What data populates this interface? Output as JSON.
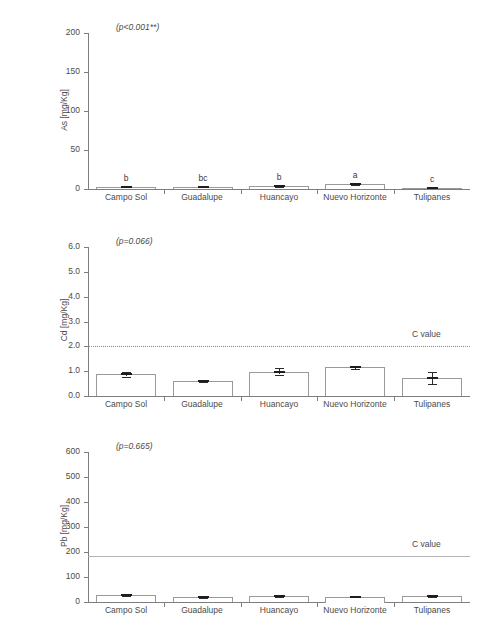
{
  "chart_data": [
    {
      "type": "bar",
      "id": "as-panel",
      "title": "",
      "ylabel": "As [mg/Kg]",
      "xlabel": "",
      "annotation": "(p<0.001**)",
      "ylim": [
        0,
        200
      ],
      "yticks": [
        0,
        50,
        100,
        150,
        200
      ],
      "ytick_labels": [
        "0",
        "50",
        "100",
        "150",
        "200"
      ],
      "categories": [
        "Campo  Sol",
        "Guadalupe",
        "Huancayo",
        "Nuevo Horizonte",
        "Tulipanes"
      ],
      "values": [
        3.0,
        3.0,
        3.5,
        6.5,
        1.5
      ],
      "errors": [
        0.8,
        0.8,
        1.0,
        1.2,
        0.8
      ],
      "significance_letters": [
        "b",
        "bc",
        "b",
        "a",
        "c"
      ],
      "grid": false,
      "legend": "none",
      "c_value": null
    },
    {
      "type": "bar",
      "id": "cd-panel",
      "title": "",
      "ylabel": "Cd [mg/Kg]",
      "xlabel": "",
      "annotation": "(p=0.066)",
      "ylim": [
        0.0,
        6.0
      ],
      "yticks": [
        0.0,
        1.0,
        2.0,
        3.0,
        4.0,
        5.0,
        6.0
      ],
      "ytick_labels": [
        "0.0",
        "1.0",
        "2.0",
        "3.0",
        "4.0",
        "5.0",
        "6.0"
      ],
      "categories": [
        "Campo  Sol",
        "Guadalupe",
        "Huancayo",
        "Nuevo Horizonte",
        "Tulipanes"
      ],
      "values": [
        0.87,
        0.61,
        0.98,
        1.16,
        0.72
      ],
      "errors": [
        0.09,
        0.03,
        0.13,
        0.06,
        0.25
      ],
      "significance_letters": [
        "",
        "",
        "",
        "",
        ""
      ],
      "grid": false,
      "legend": "none",
      "c_value": 2.0,
      "c_value_label": "C value",
      "c_value_style": "dotted"
    },
    {
      "type": "bar",
      "id": "pb-panel",
      "title": "",
      "ylabel": "Pb [mg/Kg]",
      "xlabel": "",
      "annotation": "(p=0.665)",
      "ylim": [
        0,
        600
      ],
      "yticks": [
        0,
        100,
        200,
        300,
        400,
        500,
        600
      ],
      "ytick_labels": [
        "0",
        "100",
        "200",
        "300",
        "400",
        "500",
        "600"
      ],
      "categories": [
        "Campo  Sol",
        "Guadalupe",
        "Huancayo",
        "Nuevo Horizonte",
        "Tulipanes"
      ],
      "values": [
        27,
        20,
        24,
        22,
        23
      ],
      "errors": [
        4,
        3,
        3,
        3,
        3
      ],
      "significance_letters": [
        "",
        "",
        "",
        "",
        ""
      ],
      "grid": false,
      "legend": "none",
      "c_value": 185,
      "c_value_label": "C value",
      "c_value_style": "solid"
    }
  ],
  "colors": {
    "axis": "#7d7d7d",
    "bar_edge": "#9a9a9a",
    "bar_fill": "#ffffff",
    "error": "#2b2b2b",
    "c_line": "#8a8a8a",
    "text": "#4a4a4a",
    "background": "#ffffff"
  }
}
